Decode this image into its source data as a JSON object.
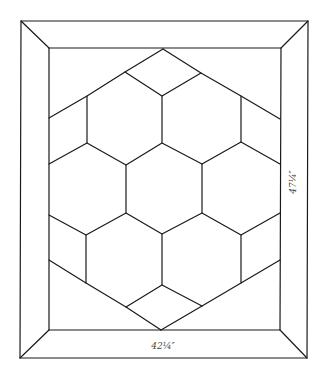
{
  "diagram": {
    "type": "stained-glass-pattern",
    "dimensions": {
      "width_label": "42¼″",
      "height_label": "47¼″"
    },
    "colors": {
      "line": "#1a1a1a",
      "label": "#444444",
      "background": "#ffffff"
    },
    "frame": {
      "outer": [
        [
          21,
          21
        ],
        [
          308,
          21
        ],
        [
          307,
          358
        ],
        [
          20,
          358
        ]
      ],
      "inner": [
        [
          49,
          48
        ],
        [
          281,
          48
        ],
        [
          280,
          330
        ],
        [
          49,
          330
        ]
      ]
    },
    "hexagon_count": 7,
    "diamond_count": 2
  }
}
